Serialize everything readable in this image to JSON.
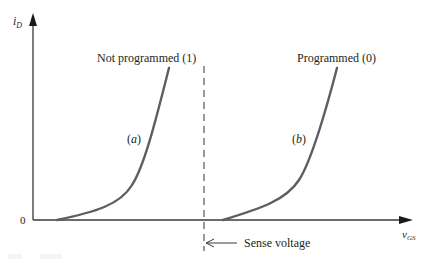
{
  "figure": {
    "type": "mosfet-transfer-characteristic",
    "y_axis": {
      "label_main": "i",
      "label_sub": "D"
    },
    "x_axis": {
      "label_main": "v",
      "label_sub": "GS"
    },
    "origin_label": "0",
    "curves": [
      {
        "id": "a",
        "tag": "(a)",
        "tag_italic": "a",
        "state_label": "Not programmed (1)"
      },
      {
        "id": "b",
        "tag": "(b)",
        "tag_italic": "b",
        "state_label": "Programmed (0)"
      }
    ],
    "sense_line": {
      "label": "Sense voltage"
    },
    "colors": {
      "axis": "#3a3a3a",
      "curve": "#5e5e5e",
      "text": "#231f20",
      "dashed": "#444444"
    }
  }
}
